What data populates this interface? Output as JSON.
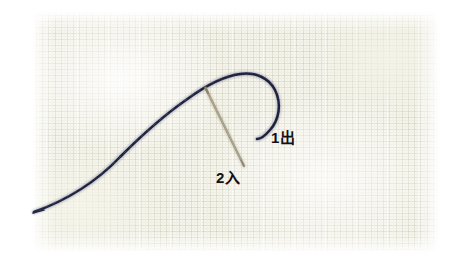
{
  "image": {
    "title": "Embroidery stitch instruction photo",
    "subject": "Needle and dark navy thread on pale linen fabric",
    "width": 470,
    "height": 272,
    "background_color": "#ffffff"
  },
  "photo": {
    "name": "stitch-photo",
    "left": 33,
    "top": 12,
    "width": 405,
    "height": 240,
    "fabric_color": "#f6f5ec",
    "fabric_weave_color": "#cecbb6",
    "fabric_highlight_color": "#ffffff"
  },
  "objects": {
    "thread": {
      "name": "embroidery-thread",
      "color": "#1e2340",
      "highlight_color": "#4b5070",
      "description": "Dark navy thread running from lower-left up to a looped hook at upper-right"
    },
    "needle": {
      "name": "sewing-needle",
      "color": "#9a9277",
      "shadow_color": "#7d7559",
      "description": "Thin tan needle angled down-right, piercing the fabric where the thread crosses"
    }
  },
  "annotations": [
    {
      "id": "label-1de",
      "name": "annotation-label-1-out",
      "text": "1出",
      "reading": "ichi de",
      "meaning": "point 1 — bring needle out",
      "color": "#121212",
      "x": 271,
      "y": 130
    },
    {
      "id": "label-2iri",
      "name": "annotation-label-2-in",
      "text": "2入",
      "reading": "ni iri",
      "meaning": "point 2 — insert needle in",
      "color": "#121212",
      "x": 216,
      "y": 170
    }
  ]
}
